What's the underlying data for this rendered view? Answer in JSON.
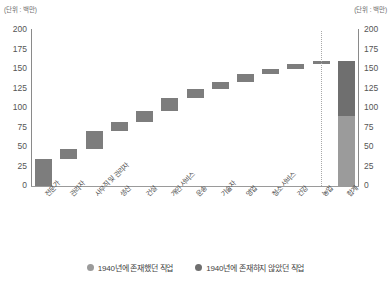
{
  "unit_note_left": "(단위 : 백만)",
  "unit_note_right": "(단위 : 백만)",
  "axis": {
    "y_ticks": [
      "200",
      "175",
      "150",
      "125",
      "100",
      "75",
      "50",
      "25",
      "0"
    ],
    "y_ticks_right": [
      "200",
      "175",
      "150",
      "125",
      "100",
      "75",
      "50",
      "25",
      "0"
    ],
    "y_min": 0,
    "y_max": 200,
    "y_step": 25
  },
  "legend": {
    "items": [
      {
        "label": "1940년에 존재했던 직업",
        "color": "#9b9b9b",
        "icon": "circle-marker-icon"
      },
      {
        "label": "1940년에 존재하지 않았던 직업",
        "color": "#6f6f6f",
        "icon": "circle-marker-icon"
      }
    ]
  },
  "chart_data": {
    "type": "bar",
    "subtype": "waterfall",
    "title": "",
    "xlabel": "",
    "ylabel": "(단위 : 백만)",
    "ylim": [
      0,
      200
    ],
    "grid": false,
    "legend_position": "bottom",
    "categories": [
      "전문가",
      "관리자",
      "사무직 및 관리자",
      "생산",
      "건설",
      "개인 서비스",
      "운송",
      "기술자",
      "영업",
      "청소 서비스",
      "건강",
      "농업",
      "합계"
    ],
    "series": [
      {
        "name": "증가분 (waterfall increment)",
        "base": [
          0,
          35,
          47,
          70,
          82,
          96,
          113,
          124,
          133,
          143,
          150,
          156,
          0
        ],
        "values": [
          35,
          12,
          23,
          12,
          14,
          17,
          11,
          9,
          10,
          7,
          6,
          4,
          160
        ],
        "cumulative": [
          35,
          47,
          70,
          82,
          96,
          113,
          124,
          133,
          143,
          150,
          156,
          160,
          160
        ]
      }
    ],
    "total_bar": {
      "category": "합계",
      "total": 160,
      "segments": [
        {
          "name": "1940년에 존재했던 직업",
          "value": 90,
          "color": "#9b9b9b"
        },
        {
          "name": "1940년에 존재하지 않았던 직업",
          "value": 70,
          "color": "#6f6f6f"
        }
      ]
    },
    "annotations": [
      {
        "type": "dotted-vertical-separator",
        "before_category": "합계"
      }
    ],
    "colors": {
      "increment_bar": "#7d7d7d",
      "existing_jobs": "#9b9b9b",
      "new_jobs": "#6f6f6f"
    }
  }
}
